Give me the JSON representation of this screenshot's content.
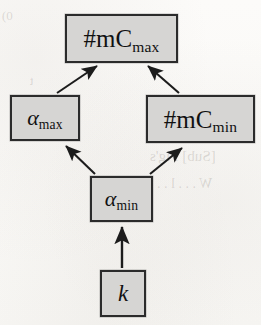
{
  "figure": {
    "type": "dependency-diagram",
    "background_color": "#fbfaf8",
    "node_fill_color": "#d6d5d3",
    "node_border_color": "#2b2b2b",
    "arrow_color": "#1c1c1c"
  },
  "nodes": [
    {
      "id": "mc-max",
      "base": "#mC",
      "subscript": "max",
      "full_label": "#mC_max",
      "italic_base": false,
      "x": 65,
      "y": 14,
      "w": 113,
      "h": 49
    },
    {
      "id": "a-max",
      "base": "α",
      "subscript": "max",
      "full_label": "α_max",
      "italic_base": true,
      "x": 10,
      "y": 95,
      "w": 70,
      "h": 46
    },
    {
      "id": "mc-min",
      "base": "#mC",
      "subscript": "min",
      "full_label": "#mC_min",
      "italic_base": false,
      "x": 146,
      "y": 95,
      "w": 109,
      "h": 48
    },
    {
      "id": "a-min",
      "base": "α",
      "subscript": "min",
      "full_label": "α_min",
      "italic_base": true,
      "x": 90,
      "y": 176,
      "w": 63,
      "h": 46
    },
    {
      "id": "k",
      "base": "k",
      "subscript": "",
      "full_label": "k",
      "italic_base": true,
      "x": 100,
      "y": 270,
      "w": 46,
      "h": 47
    }
  ],
  "edges": [
    {
      "id": "edge-a-max-to-mc-max",
      "from": "a-max",
      "to": "mc-max",
      "direction": "up-right"
    },
    {
      "id": "edge-mc-min-to-mc-max",
      "from": "mc-min",
      "to": "mc-max",
      "direction": "up-left"
    },
    {
      "id": "edge-a-min-to-a-max",
      "from": "a-min",
      "to": "a-max",
      "direction": "up-left"
    },
    {
      "id": "edge-a-min-to-mc-min",
      "from": "a-min",
      "to": "mc-min",
      "direction": "up-right"
    },
    {
      "id": "edge-k-to-a-min",
      "from": "k",
      "to": "a-min",
      "direction": "up"
    }
  ],
  "bleed_through": [
    {
      "text": "[Sub] Fig's",
      "x": 150,
      "y": 148,
      "size": 15
    },
    {
      "text": "W . . . l . . .",
      "x": 150,
      "y": 176,
      "size": 14
    },
    {
      "text": "0)",
      "x": 2,
      "y": 8,
      "size": 13
    },
    {
      "text": "t",
      "x": 30,
      "y": 74,
      "size": 12
    }
  ]
}
